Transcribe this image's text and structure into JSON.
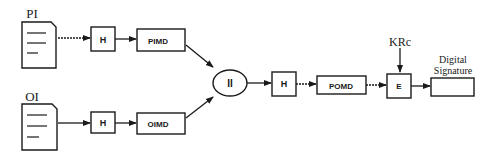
{
  "diagram": {
    "inputs": [
      {
        "id": "pi",
        "label": "PI",
        "hash_label": "H",
        "digest_label": "PIMD"
      },
      {
        "id": "oi",
        "label": "OI",
        "hash_label": "H",
        "digest_label": "OIMD"
      }
    ],
    "concat_label": "II",
    "hash_label": "H",
    "digest_label": "POMD",
    "encrypt_label": "E",
    "key_label": "KRc",
    "output_label_line1": "Digital",
    "output_label_line2": "Signature"
  }
}
